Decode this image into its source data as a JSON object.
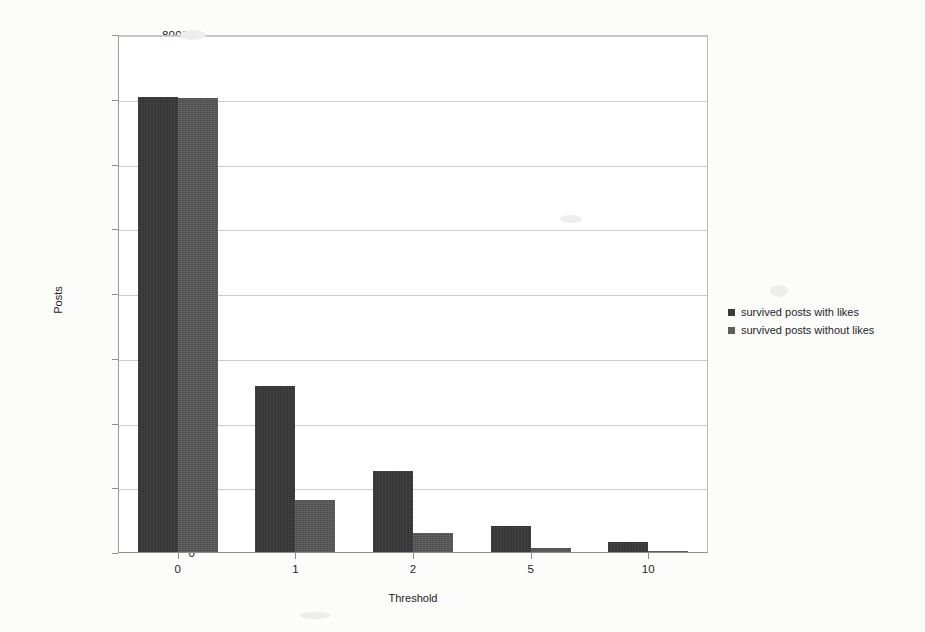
{
  "chart_data": {
    "type": "bar",
    "title": "",
    "xlabel": "Threshold",
    "ylabel": "Posts",
    "categories": [
      "0",
      "1",
      "2",
      "5",
      "10"
    ],
    "series": [
      {
        "name": "survived posts with likes",
        "color": "#383838",
        "values": [
          70500,
          25800,
          12500,
          4000,
          1500
        ]
      },
      {
        "name": "survived posts without likes",
        "color": "#565656",
        "values": [
          70400,
          8000,
          3000,
          600,
          200
        ]
      }
    ],
    "ylim": [
      0,
      80000
    ],
    "yticks": [
      0,
      10000,
      20000,
      30000,
      40000,
      50000,
      60000,
      70000,
      80000
    ],
    "ytick_labels": [
      "0",
      "10000",
      "20000",
      "30000",
      "40000",
      "50000",
      "60000",
      "70000",
      "80000"
    ],
    "grid": true,
    "legend_position": "right"
  },
  "legend": {
    "entries": [
      {
        "label": "survived posts with likes"
      },
      {
        "label": "survived posts without likes"
      }
    ]
  }
}
